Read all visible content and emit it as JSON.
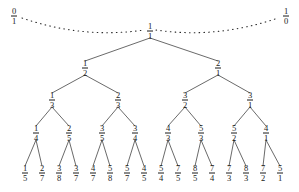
{
  "figure": {
    "type": "tree-diagram",
    "name": "stern-brocot-calkin-wilf-tree",
    "background_color": "#ffffff",
    "ink_color": "#1a1a1a"
  },
  "boundaries": [
    {
      "id": "b-left",
      "num": "0",
      "den": "1",
      "x": 14,
      "y": 16
    },
    {
      "id": "b-right",
      "num": "1",
      "den": "0",
      "x": 286,
      "y": 16
    }
  ],
  "dotted_arcs": [
    {
      "id": "arc-left",
      "from": "b-left",
      "to": "root",
      "style": "dotted"
    },
    {
      "id": "arc-right",
      "from": "root",
      "to": "b-right",
      "style": "dotted"
    }
  ],
  "levels": [
    {
      "level": 0,
      "y": 31,
      "nodes": [
        {
          "id": "n0",
          "num": "1",
          "den": "1",
          "x": 150
        }
      ]
    },
    {
      "level": 1,
      "y": 68,
      "nodes": [
        {
          "id": "n1",
          "num": "1",
          "den": "2",
          "x": 85
        },
        {
          "id": "n2",
          "num": "2",
          "den": "1",
          "x": 218
        }
      ]
    },
    {
      "level": 2,
      "y": 100,
      "nodes": [
        {
          "id": "n3",
          "num": "1",
          "den": "3",
          "x": 52
        },
        {
          "id": "n4",
          "num": "2",
          "den": "3",
          "x": 118
        },
        {
          "id": "n5",
          "num": "3",
          "den": "2",
          "x": 185
        },
        {
          "id": "n6",
          "num": "3",
          "den": "1",
          "x": 250
        }
      ]
    },
    {
      "level": 3,
      "y": 133,
      "nodes": [
        {
          "id": "n7",
          "num": "1",
          "den": "4",
          "x": 36
        },
        {
          "id": "n8",
          "num": "2",
          "den": "5",
          "x": 69
        },
        {
          "id": "n9",
          "num": "3",
          "den": "5",
          "x": 102
        },
        {
          "id": "n10",
          "num": "3",
          "den": "4",
          "x": 135
        },
        {
          "id": "n11",
          "num": "4",
          "den": "3",
          "x": 168
        },
        {
          "id": "n12",
          "num": "5",
          "den": "3",
          "x": 201
        },
        {
          "id": "n13",
          "num": "5",
          "den": "2",
          "x": 234
        },
        {
          "id": "n14",
          "num": "4",
          "den": "1",
          "x": 266
        }
      ]
    },
    {
      "level": 4,
      "y": 173,
      "nodes": [
        {
          "id": "n15",
          "num": "1",
          "den": "5",
          "x": 25
        },
        {
          "id": "n16",
          "num": "2",
          "den": "7",
          "x": 42
        },
        {
          "id": "n17",
          "num": "3",
          "den": "8",
          "x": 59
        },
        {
          "id": "n18",
          "num": "3",
          "den": "7",
          "x": 76
        },
        {
          "id": "n19",
          "num": "4",
          "den": "7",
          "x": 93
        },
        {
          "id": "n20",
          "num": "5",
          "den": "8",
          "x": 110
        },
        {
          "id": "n21",
          "num": "5",
          "den": "7",
          "x": 127
        },
        {
          "id": "n22",
          "num": "4",
          "den": "5",
          "x": 144
        },
        {
          "id": "n23",
          "num": "5",
          "den": "4",
          "x": 161
        },
        {
          "id": "n24",
          "num": "7",
          "den": "5",
          "x": 178
        },
        {
          "id": "n25",
          "num": "8",
          "den": "5",
          "x": 195
        },
        {
          "id": "n26",
          "num": "7",
          "den": "4",
          "x": 212
        },
        {
          "id": "n27",
          "num": "7",
          "den": "3",
          "x": 229
        },
        {
          "id": "n28",
          "num": "8",
          "den": "3",
          "x": 246
        },
        {
          "id": "n29",
          "num": "7",
          "den": "2",
          "x": 263
        },
        {
          "id": "n30",
          "num": "5",
          "den": "1",
          "x": 280
        }
      ]
    }
  ],
  "edges": [
    {
      "from": "n0",
      "to": "n1"
    },
    {
      "from": "n0",
      "to": "n2"
    },
    {
      "from": "n1",
      "to": "n3"
    },
    {
      "from": "n1",
      "to": "n4"
    },
    {
      "from": "n2",
      "to": "n5"
    },
    {
      "from": "n2",
      "to": "n6"
    },
    {
      "from": "n3",
      "to": "n7"
    },
    {
      "from": "n3",
      "to": "n8"
    },
    {
      "from": "n4",
      "to": "n9"
    },
    {
      "from": "n4",
      "to": "n10"
    },
    {
      "from": "n5",
      "to": "n11"
    },
    {
      "from": "n5",
      "to": "n12"
    },
    {
      "from": "n6",
      "to": "n13"
    },
    {
      "from": "n6",
      "to": "n14"
    },
    {
      "from": "n7",
      "to": "n15"
    },
    {
      "from": "n7",
      "to": "n16"
    },
    {
      "from": "n8",
      "to": "n17"
    },
    {
      "from": "n8",
      "to": "n18"
    },
    {
      "from": "n9",
      "to": "n19"
    },
    {
      "from": "n9",
      "to": "n20"
    },
    {
      "from": "n10",
      "to": "n21"
    },
    {
      "from": "n10",
      "to": "n22"
    },
    {
      "from": "n11",
      "to": "n23"
    },
    {
      "from": "n11",
      "to": "n24"
    },
    {
      "from": "n12",
      "to": "n25"
    },
    {
      "from": "n12",
      "to": "n26"
    },
    {
      "from": "n13",
      "to": "n27"
    },
    {
      "from": "n13",
      "to": "n28"
    },
    {
      "from": "n14",
      "to": "n29"
    },
    {
      "from": "n14",
      "to": "n30"
    }
  ]
}
